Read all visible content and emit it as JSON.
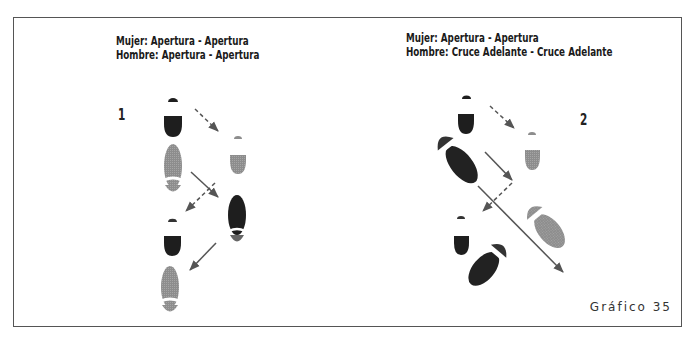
{
  "figure": {
    "label": "Gráfico 35",
    "colors": {
      "man_foot": "#1e1e1e",
      "woman_foot": "#8a8a8a",
      "arrow": "#555555",
      "frame": "#555555"
    }
  },
  "panels": [
    {
      "number": "1",
      "caption": {
        "line1": "Mujer:  Apertura - Apertura",
        "line2": "Hombre: Apertura  - Apertura"
      }
    },
    {
      "number": "2",
      "caption": {
        "line1": "Mujer:  Apertura - Apertura",
        "line2": "Hombre: Cruce Adelante  - Cruce Adelante"
      }
    }
  ],
  "legend_icons": {
    "man": "dark-footprint-icon",
    "woman": "light-footprint-icon",
    "solid_arrow": "man-step-arrow-icon",
    "dashed_arrow": "woman-step-arrow-icon"
  }
}
